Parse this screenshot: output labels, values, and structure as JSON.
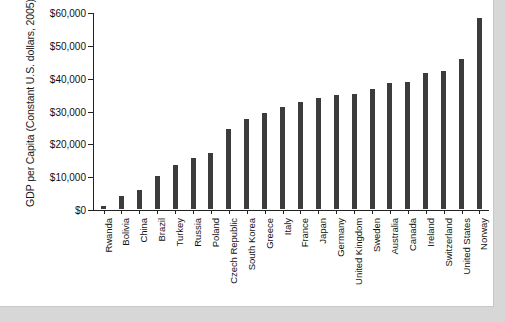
{
  "chart_data": {
    "type": "bar",
    "title": "",
    "subtitle": "",
    "xlabel": "",
    "ylabel": "GDP per Capita (Constant U.S. dollars, 2005)",
    "ylim": [
      0,
      60000
    ],
    "ytick_values": [
      0,
      10000,
      20000,
      30000,
      40000,
      50000,
      60000
    ],
    "ytick_labels": [
      "$0",
      "$10,000",
      "$20,000",
      "$30,000",
      "$40,000",
      "$50,000",
      "$60,000"
    ],
    "grid": false,
    "legend": false,
    "legend_position": "none",
    "bar_color": "#3c3c3c",
    "categories": [
      "Rwanda",
      "Bolivia",
      "China",
      "Brazil",
      "Turkey",
      "Russia",
      "Poland",
      "Czech Republic",
      "South Korea",
      "Greece",
      "Italy",
      "France",
      "Japan",
      "Germany",
      "United Kingdom",
      "Sweden",
      "Australia",
      "Canada",
      "Ireland",
      "Switzerland",
      "United States",
      "Norway"
    ],
    "values": [
      800,
      4000,
      5800,
      10200,
      13300,
      15600,
      17100,
      24400,
      27400,
      29100,
      31000,
      32700,
      33800,
      34800,
      35100,
      36500,
      38400,
      38700,
      41400,
      41900,
      45700,
      58100
    ]
  }
}
